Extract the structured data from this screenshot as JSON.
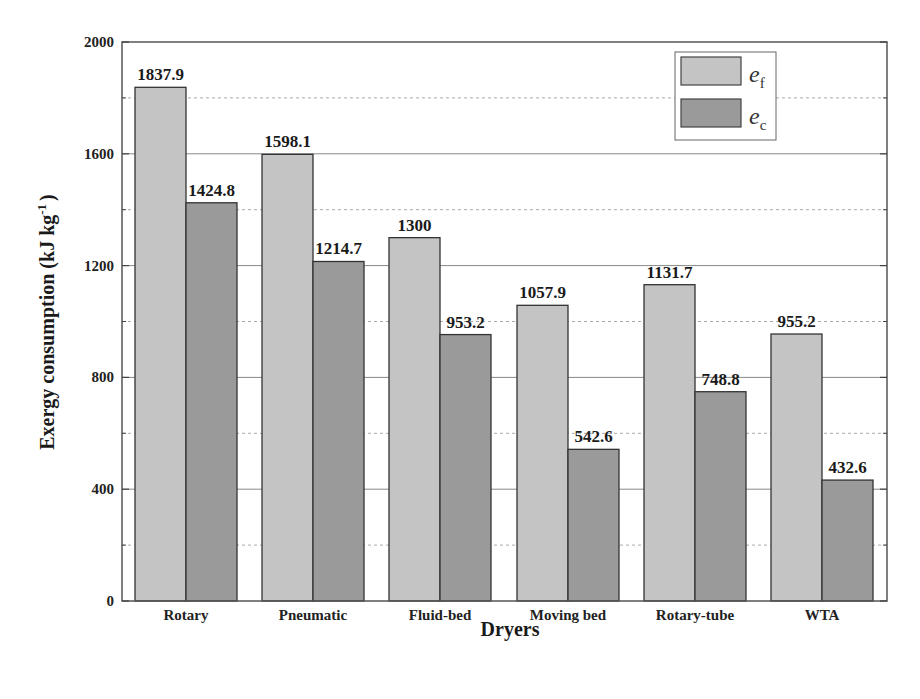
{
  "chart_data": {
    "type": "bar",
    "title": "",
    "xlabel": "Dryers",
    "ylabel": "Exergy consumption (kJ kg-1)",
    "ylabel_parts": {
      "main": "Exergy consumption (kJ kg",
      "sup": "-1",
      "close": ")"
    },
    "ylim": [
      0,
      2000
    ],
    "yticks": [
      0,
      400,
      800,
      1200,
      1600,
      2000
    ],
    "grid": {
      "major": [
        400,
        800,
        1200,
        1600
      ],
      "minor_dashed": [
        200,
        600,
        1000,
        1400,
        1800
      ]
    },
    "categories": [
      "Rotary",
      "Pneumatic",
      "Fluid-bed",
      "Moving bed",
      "Rotary-tube",
      "WTA"
    ],
    "series": [
      {
        "name": "e_f",
        "label_main": "e",
        "label_sub": "f",
        "color": "#c4c4c4",
        "values": [
          1837.9,
          1598.1,
          1300,
          1057.9,
          1131.7,
          955.2
        ],
        "value_labels": [
          "1837.9",
          "1598.1",
          "1300",
          "1057.9",
          "1131.7",
          "955.2"
        ]
      },
      {
        "name": "e_c",
        "label_main": "e",
        "label_sub": "c",
        "color": "#9a9a9a",
        "values": [
          1424.8,
          1214.7,
          953.2,
          542.6,
          748.8,
          432.6
        ],
        "value_labels": [
          "1424.8",
          "1214.7",
          "953.2",
          "542.6",
          "748.8",
          "432.6"
        ]
      }
    ],
    "legend_position": "top-right"
  }
}
